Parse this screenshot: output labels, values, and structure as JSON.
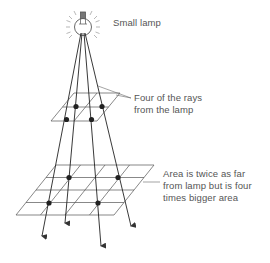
{
  "diagram": {
    "type": "inverse-square-law-illustration",
    "labels": {
      "lamp": "Small lamp",
      "rays_line1": "Four of the rays",
      "rays_line2": "from the lamp",
      "area_line1": "Area is twice as far",
      "area_line2": "from lamp but is four",
      "area_line3": "times bigger area"
    },
    "elements": {
      "light_source": "small lamp (bulb with radiating glow lines)",
      "rays_count": 4,
      "near_plane_grid": "2 x 2",
      "far_plane_grid": "4 x 4",
      "far_plane_distance_ratio": 2,
      "far_plane_area_ratio": 4
    },
    "colors": {
      "line": "#333333",
      "text": "#555555",
      "background": "#ffffff"
    }
  }
}
